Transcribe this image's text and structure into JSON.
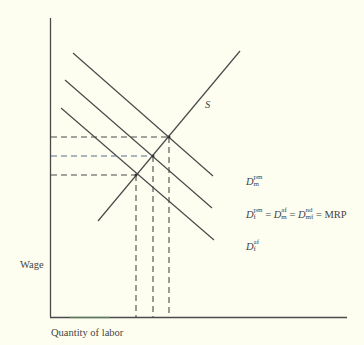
{
  "diagram": {
    "y_axis_label": "Wage",
    "x_axis_label": "Quantity of labor",
    "supply_label": "S",
    "curves": {
      "top": {
        "base": "D",
        "sup": "pm",
        "sub": "m"
      },
      "middle": {
        "terms": [
          {
            "base": "D",
            "sup": "pm",
            "sub": "f"
          },
          {
            "base": "D",
            "sup": "af",
            "sub": "m"
          },
          {
            "base": "D",
            "sup": "nd",
            "sub": "mf"
          }
        ],
        "equals": "=",
        "mrp": "MRP"
      },
      "bottom": {
        "base": "D",
        "sup": "af",
        "sub": "f"
      }
    },
    "colors": {
      "background": "#fefef0",
      "line": "#4a4a4a",
      "dashed_middle": "#5a6a8a"
    }
  }
}
